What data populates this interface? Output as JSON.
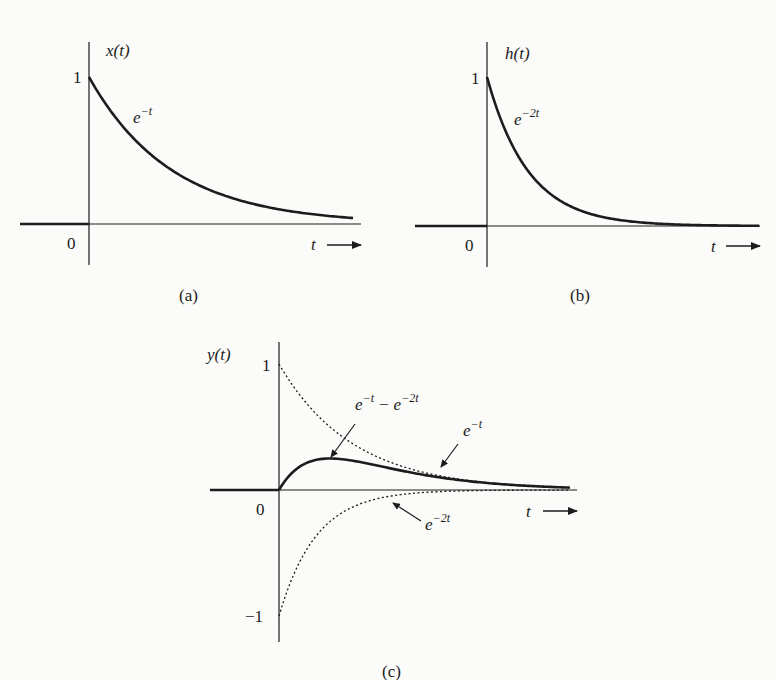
{
  "figure": {
    "panels": [
      {
        "id": "a",
        "caption": "(a)",
        "ylabel": "x(t)",
        "xlabel": "t",
        "origin_label": "0",
        "ytick_label": "1",
        "curve_label_base": "e",
        "curve_label_exp": "−t"
      },
      {
        "id": "b",
        "caption": "(b)",
        "ylabel": "h(t)",
        "xlabel": "t",
        "origin_label": "0",
        "ytick_label": "1",
        "curve_label_base": "e",
        "curve_label_exp": "−2t"
      },
      {
        "id": "c",
        "caption": "(c)",
        "ylabel": "y(t)",
        "xlabel": "t",
        "origin_label": "0",
        "ytick_top_label": "1",
        "ytick_bottom_label": "−1",
        "annotations": [
          {
            "base1": "e",
            "exp1": "−t",
            "op": "−",
            "base2": "e",
            "exp2": "−2t"
          },
          {
            "base": "e",
            "exp": "−t"
          },
          {
            "base": "e",
            "exp": "−2t"
          }
        ]
      }
    ],
    "colors": {
      "ink": "#1c1c1c",
      "background": "#fbfbf9"
    }
  },
  "chart_data": [
    {
      "type": "line",
      "title": "(a)",
      "xlabel": "t",
      "ylabel": "x(t)",
      "series": [
        {
          "name": "e^{-t}",
          "x": [
            0,
            0.5,
            1,
            1.5,
            2,
            2.5,
            3,
            3.2
          ],
          "values": [
            1,
            0.607,
            0.368,
            0.223,
            0.135,
            0.082,
            0.05,
            0.041
          ]
        }
      ],
      "ylim": [
        0,
        1
      ],
      "grid": false
    },
    {
      "type": "line",
      "title": "(b)",
      "xlabel": "t",
      "ylabel": "h(t)",
      "series": [
        {
          "name": "e^{-2t}",
          "x": [
            0,
            0.5,
            1,
            1.5,
            2,
            2.5,
            3,
            3.3
          ],
          "values": [
            1,
            0.368,
            0.135,
            0.05,
            0.018,
            0.007,
            0.002,
            0.001
          ]
        }
      ],
      "ylim": [
        0,
        1
      ],
      "grid": false
    },
    {
      "type": "line",
      "title": "(c)",
      "xlabel": "t",
      "ylabel": "y(t)",
      "series": [
        {
          "name": "e^{-t} - e^{-2t}",
          "style": "solid",
          "x": [
            0,
            0.5,
            0.693,
            1,
            1.5,
            2,
            2.5,
            3,
            3.5,
            3.95
          ],
          "values": [
            0,
            0.239,
            0.25,
            0.233,
            0.173,
            0.117,
            0.075,
            0.047,
            0.029,
            0.019
          ]
        },
        {
          "name": "e^{-t}",
          "style": "dotted",
          "x": [
            0,
            0.5,
            1,
            1.5,
            2,
            2.5,
            3,
            3.5,
            3.95
          ],
          "values": [
            1,
            0.607,
            0.368,
            0.223,
            0.135,
            0.082,
            0.05,
            0.03,
            0.019
          ]
        },
        {
          "name": "-e^{-2t}",
          "style": "dotted",
          "x": [
            0,
            0.5,
            1,
            1.5,
            2,
            2.5,
            3,
            3.5,
            3.95
          ],
          "values": [
            -1,
            -0.368,
            -0.135,
            -0.05,
            -0.018,
            -0.007,
            -0.002,
            -0.001,
            0
          ]
        }
      ],
      "ylim": [
        -1,
        1
      ],
      "grid": false
    }
  ]
}
